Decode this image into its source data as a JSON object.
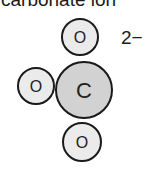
{
  "title": "carbonate ion",
  "charge": "2−",
  "colors": {
    "carbon_fill": "#d2d2d2",
    "oxygen_fill": "#ebebeb",
    "outline": "#1a1a1a"
  },
  "atoms": [
    {
      "id": "oxygen-top",
      "label": "O",
      "cx": 80,
      "cy": 37,
      "r": 18
    },
    {
      "id": "oxygen-left",
      "label": "O",
      "cx": 36,
      "cy": 86,
      "r": 18
    },
    {
      "id": "carbon-center",
      "label": "C",
      "cx": 84,
      "cy": 90,
      "r": 28
    },
    {
      "id": "oxygen-bottom",
      "label": "O",
      "cx": 82,
      "cy": 142,
      "r": 19
    }
  ]
}
